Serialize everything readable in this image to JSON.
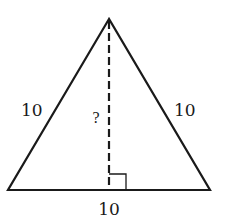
{
  "diagram": {
    "type": "equilateral-triangle-height",
    "labels": {
      "left_side": "10",
      "right_side": "10",
      "base": "10",
      "height": "?"
    },
    "colors": {
      "stroke": "#1a1a1a",
      "background": "#ffffff"
    }
  }
}
